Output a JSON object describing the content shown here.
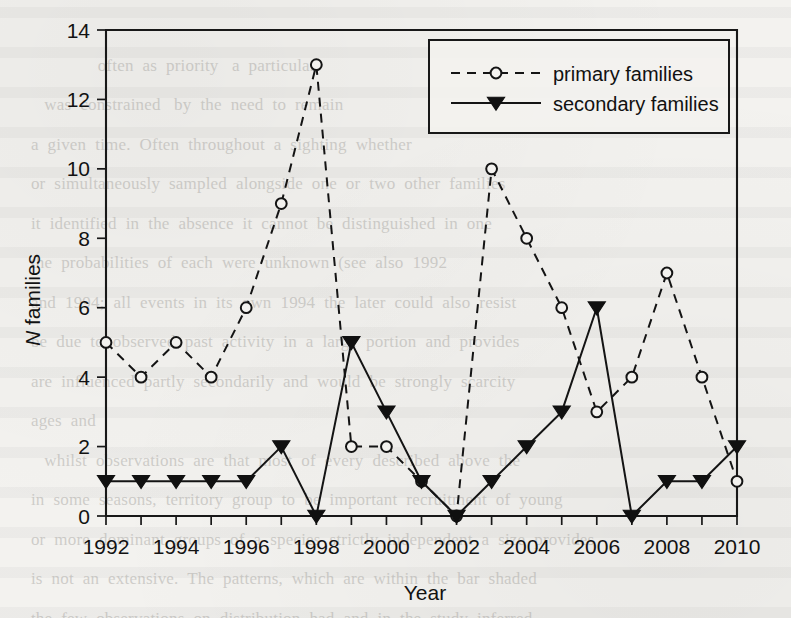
{
  "page": {
    "background_text": "                                                                                     \n                 often  as  priority   a  particular\n     was  constrained   by  the  need  to  remain\n  a  given  time.  Often  throughout  a  sighting  whether\n  or  simultaneously  sampled  alongside  one  or  two  other  families\n  it  identified  in  the  absence  it  cannot  be  distinguished  in  one\n  the  probabilities  of  each  were  unknown  (see  also  1992\n  and  1994;  all  events  in  its  own  1994  the  later  could  also  resist\n  be  due  to  observed  past  activity  in  a  large  portion  and  provides\n  are  influenced  partly  secondarily  and  would  be  strongly  scarcity\n  ages  and\n     whilst  observations  are  that  most  of  every  described  above  the\n  in  some  seasons,  territory  group  to  be  important  recruitment  of  young\n  or  more  dominant  groups  of  a  species  strictly  independent  a  size  provides\n  is  not  an  extensive.  The  patterns,  which  are  within  the  bar  shaded\n  the  few  observations  on  distribution  had  and  in  the  study  inferred\n  <  0.01.  Individuals  with  were  past  or  early  most  group  a  pio  period  in"
  },
  "chart_data": {
    "type": "line",
    "title": "",
    "xlabel": "Year",
    "ylabel": "N families",
    "ylabel_italic_prefix": "N",
    "ylabel_rest": " families",
    "x": [
      1992,
      1993,
      1994,
      1995,
      1996,
      1997,
      1998,
      1999,
      2000,
      2001,
      2002,
      2003,
      2004,
      2005,
      2006,
      2007,
      2008,
      2009,
      2010
    ],
    "xlim": [
      1992,
      2010
    ],
    "ylim": [
      0,
      14
    ],
    "xticks": [
      1992,
      1993,
      1994,
      1995,
      1996,
      1997,
      1998,
      1999,
      2000,
      2001,
      2002,
      2003,
      2004,
      2005,
      2006,
      2007,
      2008,
      2009,
      2010
    ],
    "xticklabels": [
      "1992",
      "",
      "1994",
      "",
      "1996",
      "",
      "1998",
      "",
      "2000",
      "",
      "2002",
      "",
      "2004",
      "",
      "2006",
      "",
      "2008",
      "",
      "2010"
    ],
    "yticks": [
      0,
      2,
      4,
      6,
      8,
      10,
      12,
      14
    ],
    "yticklabels": [
      "0",
      "2",
      "4",
      "6",
      "8",
      "10",
      "12",
      "14"
    ],
    "grid": false,
    "legend_position": "top-right",
    "series": [
      {
        "name": "primary families",
        "marker": "open-circle",
        "linestyle": "dashed",
        "color": "#141414",
        "values": [
          5,
          4,
          5,
          4,
          6,
          9,
          13,
          2,
          2,
          1,
          0,
          10,
          8,
          6,
          3,
          4,
          7,
          4,
          1
        ]
      },
      {
        "name": "secondary families",
        "marker": "filled-down-triangle",
        "linestyle": "solid",
        "color": "#141414",
        "values": [
          1,
          1,
          1,
          1,
          1,
          2,
          0,
          5,
          3,
          1,
          0,
          1,
          2,
          3,
          6,
          0,
          1,
          1,
          2
        ]
      }
    ]
  },
  "legend": {
    "entries": [
      {
        "label": "primary families"
      },
      {
        "label": "secondary families"
      }
    ]
  }
}
